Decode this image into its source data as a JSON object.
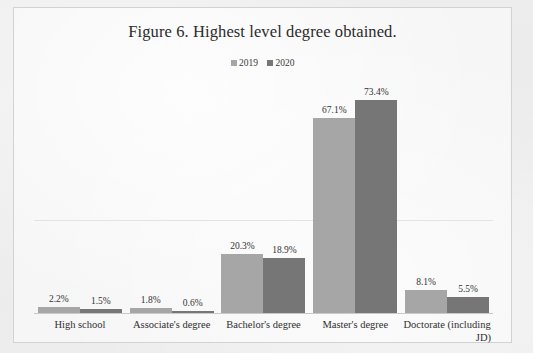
{
  "figure": {
    "title": "Figure 6. Highest level degree obtained."
  },
  "colors": {
    "series_2019": "#a6a6a6",
    "series_2020": "#767676",
    "frame_border": "#d2d2d4",
    "gridline": "#e3e3e4",
    "baseline": "#c9c9cb",
    "page_background": "#ececed",
    "plot_background": "#f6f6f6",
    "text": "#2b2b2b"
  },
  "legend": {
    "position": "top-center",
    "items": [
      {
        "label": "2019",
        "color": "#a6a6a6"
      },
      {
        "label": "2020",
        "color": "#767676"
      }
    ]
  },
  "chart_data": {
    "type": "bar",
    "title": "Figure 6. Highest level degree obtained.",
    "xlabel": "",
    "ylabel": "",
    "ylim": [
      0,
      80
    ],
    "grid": true,
    "legend_position": "top-center",
    "value_suffix": "%",
    "categories": [
      "High school",
      "Associate's degree",
      "Bachelor's degree",
      "Master's degree",
      "Doctorate (including JD)"
    ],
    "category_lines": [
      [
        "High school"
      ],
      [
        "Associate's degree"
      ],
      [
        "Bachelor's degree"
      ],
      [
        "Master's degree"
      ],
      [
        "Doctorate (including",
        "JD)"
      ]
    ],
    "series": [
      {
        "name": "2019",
        "color": "#a6a6a6",
        "values": [
          2.2,
          1.8,
          20.3,
          67.1,
          8.1
        ],
        "labels": [
          "2.2%",
          "1.8%",
          "20.3%",
          "67.1%",
          "8.1%"
        ]
      },
      {
        "name": "2020",
        "color": "#767676",
        "values": [
          1.5,
          0.6,
          18.9,
          73.4,
          5.5
        ],
        "labels": [
          "1.5%",
          "0.6%",
          "18.9%",
          "73.4%",
          "5.5%"
        ]
      }
    ]
  }
}
